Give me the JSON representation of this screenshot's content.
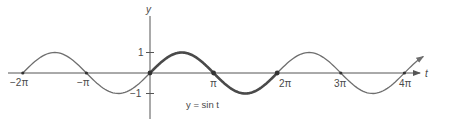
{
  "chart_data": {
    "type": "line",
    "title": "",
    "function": "y = sin t",
    "xlabel": "t",
    "ylabel": "y",
    "annotation": "y = sin t",
    "x_ticks": [
      "−2π",
      "−π",
      "π",
      "2π",
      "3π",
      "4π"
    ],
    "x_tick_values": [
      -6.2832,
      -3.1416,
      3.1416,
      6.2832,
      9.4248,
      12.5664
    ],
    "y_ticks": [
      "1",
      "−1"
    ],
    "y_tick_values": [
      1,
      -1
    ],
    "xlim": [
      -6.8,
      14.0
    ],
    "ylim": [
      -1.5,
      1.6
    ],
    "grid": false,
    "legend": null,
    "highlighted_interval": {
      "from": 0,
      "to": 6.2832,
      "label": "one period [0, 2π] drawn bold"
    },
    "marked_points": [
      {
        "t": -6.2832,
        "y": 0
      },
      {
        "t": -3.1416,
        "y": 0
      },
      {
        "t": 0,
        "y": 0
      },
      {
        "t": 3.1416,
        "y": 0
      },
      {
        "t": 6.2832,
        "y": 0
      },
      {
        "t": 9.4248,
        "y": 0
      },
      {
        "t": 12.5664,
        "y": 0
      }
    ],
    "series": [
      {
        "name": "sin t",
        "x": [
          -6.2832,
          -4.7124,
          -3.1416,
          -1.5708,
          0,
          1.5708,
          3.1416,
          4.7124,
          6.2832,
          7.854,
          9.4248,
          10.9956,
          12.5664,
          13.5
        ],
        "values": [
          0,
          1,
          0,
          -1,
          0,
          1,
          0,
          -1,
          0,
          1,
          0,
          -1,
          0,
          0.8
        ]
      }
    ]
  },
  "labels": {
    "y_axis": "y",
    "t_axis": "t",
    "tick_neg2pi": "−2π",
    "tick_negpi": "−π",
    "tick_pi": "π",
    "tick_2pi": "2π",
    "tick_3pi": "3π",
    "tick_4pi": "4π",
    "tick_1": "1",
    "tick_neg1": "−1",
    "equation": "y = sin t"
  },
  "colors": {
    "axis": "#555555",
    "curve": "#6e6e6e",
    "highlight": "#4a4a4a",
    "text": "#4a4a4a"
  }
}
